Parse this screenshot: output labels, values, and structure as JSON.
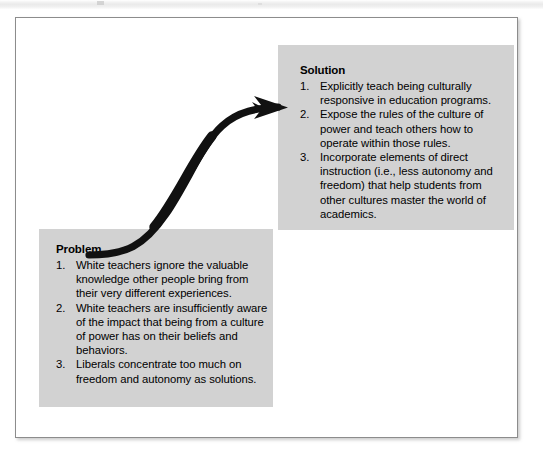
{
  "figure": {
    "kind": "problem-solution-flow-diagram",
    "accent_color": "#d2d2d2",
    "arrow_color": "#111111",
    "frame_border_color": "#8c8c8c",
    "background_color": "#ffffff"
  },
  "solution_box": {
    "title": "Solution",
    "items": [
      {
        "number": "1.",
        "text": "Explicitly teach being culturally responsive in education programs."
      },
      {
        "number": "2.",
        "text": "Expose the rules of the culture of power and teach others how to operate within those rules."
      },
      {
        "number": "3.",
        "text": "Incorporate elements of direct instruction (i.e., less autonomy and freedom) that help students from other cultures master the world of academics."
      }
    ]
  },
  "problem_box": {
    "title": "Problem",
    "items": [
      {
        "number": "1.",
        "text": "White teachers ignore the valuable knowledge other people bring from their very different experiences."
      },
      {
        "number": "2.",
        "text": "White teachers are insufficiently aware of the impact that being from a culture of power has on their beliefs and behaviors."
      },
      {
        "number": "3.",
        "text": "Liberals concentrate too much on freedom and autonomy as solutions."
      }
    ]
  },
  "arrow": {
    "semantic": "curved-arrow-problem-to-solution",
    "direction": "from problem box to solution box",
    "style": "thick black S-curve with solid arrowhead"
  }
}
